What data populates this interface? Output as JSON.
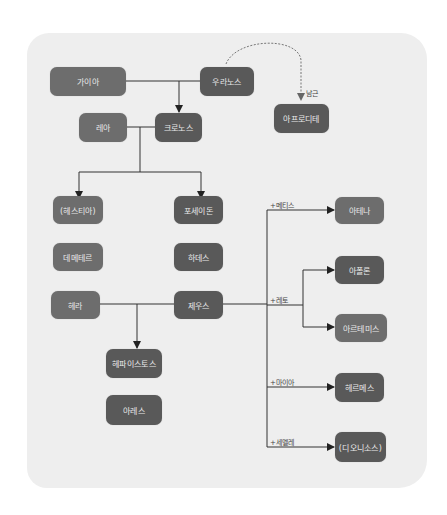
{
  "diagram": {
    "title": "",
    "colors": {
      "panel_bg": "#eeeeee",
      "male_node": "#595959",
      "female_node": "#6d6d6d",
      "node_text": "#e9e9e9",
      "line": "#333333",
      "dashed_line": "#777777"
    },
    "nodes": {
      "gaia": "가이아",
      "uranus": "우라노스",
      "aphrodite": "아프로디테",
      "rhea": "레아",
      "cronus": "크로노스",
      "hestia": "(헤스티아)",
      "poseidon": "포세이돈",
      "demeter": "데메테르",
      "hades": "하데스",
      "hera": "헤라",
      "zeus": "제우스",
      "hephaestus": "헤파이스토스",
      "ares": "아레스",
      "athena": "아테나",
      "apollo": "아폴론",
      "artemis": "아르테미스",
      "hermes": "헤르메스",
      "dionysus": "(디오니소스)"
    },
    "edge_labels": {
      "phallus": "남근",
      "metis": "+메티스",
      "leto": "+레토",
      "maia": "+마이아",
      "semele": "+세멜레"
    }
  }
}
